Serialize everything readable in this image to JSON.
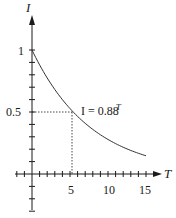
{
  "chart_data": {
    "type": "line",
    "title": "",
    "xlabel": "T",
    "ylabel": "I",
    "xlim": [
      0,
      15
    ],
    "ylim": [
      0,
      1
    ],
    "grid": false,
    "x_ticks": [
      5,
      10,
      15
    ],
    "x_tick_labels": [
      "5",
      "10",
      "15"
    ],
    "y_ticks": [
      0.5,
      1
    ],
    "y_tick_labels": [
      "0.5",
      "1"
    ],
    "x_minor_tick_step": 1,
    "y_minor_tick_step": 0.1,
    "series": [
      {
        "name": "I = 0.88^T",
        "formula": "I = 0.88^T",
        "x": [
          0,
          1,
          2,
          3,
          4,
          5,
          6,
          7,
          8,
          9,
          10,
          11,
          12,
          13,
          14,
          15
        ],
        "values": [
          1.0,
          0.88,
          0.774,
          0.681,
          0.6,
          0.528,
          0.464,
          0.409,
          0.36,
          0.316,
          0.279,
          0.245,
          0.216,
          0.19,
          0.167,
          0.147
        ]
      }
    ],
    "annotations": [
      {
        "text": "I = 0.88",
        "superscript": "T",
        "near_x": 5.5,
        "near_y": 0.5
      },
      {
        "type": "dotted-guide",
        "from": [
          0,
          0.5
        ],
        "to": [
          5,
          0.5
        ]
      },
      {
        "type": "dotted-guide",
        "from": [
          5,
          0
        ],
        "to": [
          5,
          0.5
        ]
      }
    ],
    "legend": null
  },
  "labels": {
    "x_axis": "T",
    "y_axis": "I",
    "annotation_base": "I = 0.88",
    "annotation_exp": "T",
    "ytick_1": "1",
    "ytick_05": "0.5",
    "xtick_5": "5",
    "xtick_10": "10",
    "xtick_15": "15"
  },
  "colors": {
    "ink": "#1a1a1a",
    "background": "#ffffff"
  }
}
